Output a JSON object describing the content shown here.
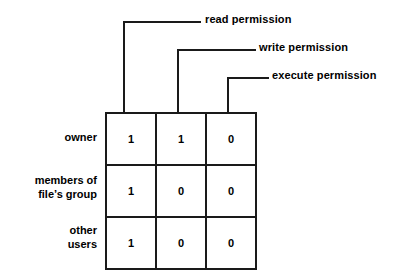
{
  "diagram": {
    "background_color": "#ffffff",
    "line_color": "#1a1a1a",
    "text_color": "#000000"
  },
  "callouts": [
    {
      "id": "read",
      "label": "read permission",
      "target_column": 0
    },
    {
      "id": "write",
      "label": "write permission",
      "target_column": 1
    },
    {
      "id": "execute",
      "label": "execute permission",
      "target_column": 2
    }
  ],
  "row_labels": [
    {
      "lines": [
        "owner"
      ]
    },
    {
      "lines": [
        "members of",
        "file’s group"
      ]
    },
    {
      "lines": [
        "other",
        "users"
      ]
    }
  ],
  "chart_data": {
    "type": "table",
    "xlabel": "",
    "ylabel": "",
    "categories": [
      "read permission",
      "write permission",
      "execute permission"
    ],
    "row_categories": [
      "owner",
      "members of file’s group",
      "other users"
    ],
    "series": [
      {
        "name": "owner",
        "values": [
          1,
          1,
          0
        ]
      },
      {
        "name": "members of file’s group",
        "values": [
          1,
          0,
          0
        ]
      },
      {
        "name": "other users",
        "values": [
          1,
          0,
          0
        ]
      }
    ],
    "cells": [
      [
        "1",
        "1",
        "0"
      ],
      [
        "1",
        "0",
        "0"
      ],
      [
        "1",
        "0",
        "0"
      ]
    ],
    "grid": true,
    "legend": "none"
  }
}
